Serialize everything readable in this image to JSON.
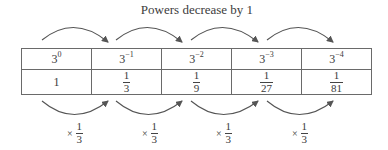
{
  "title": "Powers decrease by 1",
  "table": {
    "exponent_row": [
      {
        "base": "3",
        "exp": "0"
      },
      {
        "base": "3",
        "exp": "−1"
      },
      {
        "base": "3",
        "exp": "−2"
      },
      {
        "base": "3",
        "exp": "−3"
      },
      {
        "base": "3",
        "exp": "−4"
      }
    ],
    "value_row": [
      {
        "whole": "1"
      },
      {
        "num": "1",
        "den": "3"
      },
      {
        "num": "1",
        "den": "9"
      },
      {
        "num": "1",
        "den": "27"
      },
      {
        "num": "1",
        "den": "81"
      }
    ]
  },
  "multipliers": [
    {
      "symbol": "×",
      "num": "1",
      "den": "3"
    },
    {
      "symbol": "×",
      "num": "1",
      "den": "3"
    },
    {
      "symbol": "×",
      "num": "1",
      "den": "3"
    },
    {
      "symbol": "×",
      "num": "1",
      "den": "3"
    }
  ],
  "colors": {
    "arrow": "#555555",
    "border": "#6a6a6a",
    "text": "#3a3a3a"
  }
}
